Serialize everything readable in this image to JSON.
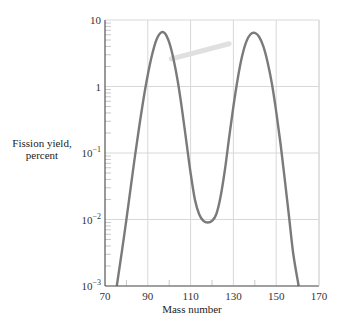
{
  "chart_data": {
    "type": "line",
    "title": "",
    "xlabel": "Mass number",
    "ylabel": "Fission yield, percent",
    "ylabel_lines": [
      "Fission yield,",
      "percent"
    ],
    "xscale": "linear",
    "yscale": "log",
    "xlim": [
      70,
      170
    ],
    "ylim": [
      0.001,
      10
    ],
    "x_ticks": [
      70,
      90,
      110,
      130,
      150,
      170
    ],
    "x_tick_labels": [
      "70",
      "90",
      "110",
      "130",
      "150",
      "170"
    ],
    "y_ticks": [
      0.001,
      0.01,
      0.1,
      1,
      10
    ],
    "y_tick_labels": [
      {
        "base": "10",
        "exp": "−3"
      },
      {
        "base": "10",
        "exp": "−2"
      },
      {
        "base": "10",
        "exp": "−1"
      },
      {
        "base": "1",
        "exp": ""
      },
      {
        "base": "10",
        "exp": ""
      }
    ],
    "grid": true,
    "legend": null,
    "line_color": "#7a7a7a",
    "grid_color": "#d8d8d8",
    "series": [
      {
        "name": "Fission yield",
        "x": [
          75.5,
          78,
          80,
          82,
          84,
          86,
          88,
          90,
          92,
          94,
          96,
          98,
          100,
          102,
          104,
          106,
          108,
          110,
          112,
          114,
          116,
          118,
          120,
          122,
          124,
          126,
          128,
          130,
          132,
          134,
          136,
          138,
          140,
          142,
          144,
          146,
          148,
          150,
          152,
          154,
          156,
          158,
          160.5
        ],
        "y": [
          0.001,
          0.0035,
          0.01,
          0.03,
          0.09,
          0.25,
          0.65,
          1.5,
          3.0,
          5.0,
          6.4,
          6.3,
          4.6,
          2.6,
          1.2,
          0.45,
          0.15,
          0.05,
          0.02,
          0.012,
          0.0095,
          0.009,
          0.0095,
          0.012,
          0.022,
          0.055,
          0.17,
          0.5,
          1.3,
          2.8,
          4.7,
          6.1,
          6.4,
          5.6,
          4.0,
          2.3,
          1.1,
          0.42,
          0.14,
          0.04,
          0.011,
          0.003,
          0.001
        ]
      }
    ],
    "annotations": [
      {
        "type": "faint-leader-line",
        "from": [
          101,
          2.6
        ],
        "to": [
          128,
          4.4
        ],
        "color": "#e0e0e0"
      }
    ],
    "layout": {
      "plot_left_px": 105,
      "plot_right_px": 319,
      "plot_top_px": 20,
      "plot_bottom_px": 286
    }
  }
}
